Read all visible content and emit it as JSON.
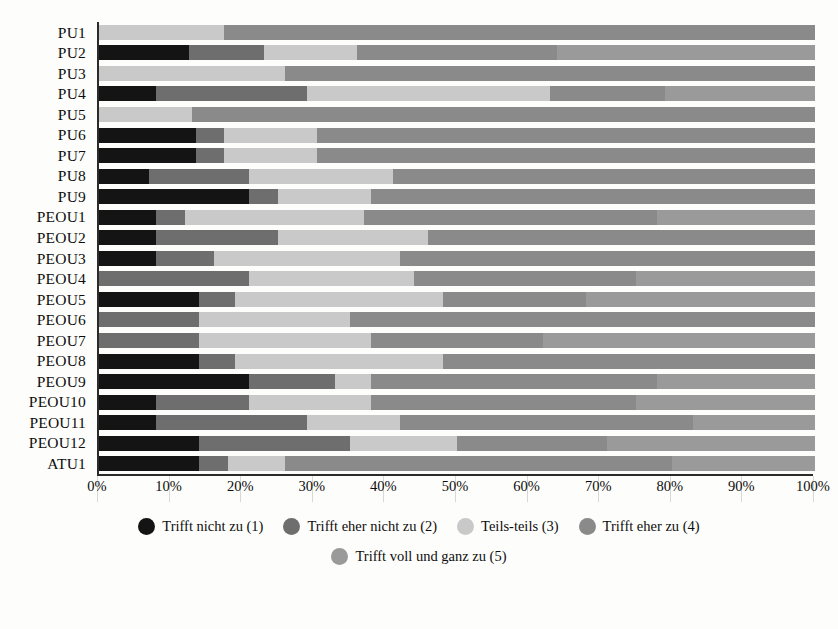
{
  "chart_data": {
    "type": "bar",
    "subtype": "stacked-horizontal-100-percent",
    "title": "",
    "xlabel": "",
    "ylabel": "",
    "xlim": [
      0,
      100
    ],
    "grid": true,
    "legend_position": "bottom",
    "xticks": [
      "0%",
      "10%",
      "20%",
      "30%",
      "40%",
      "50%",
      "60%",
      "70%",
      "80%",
      "90%",
      "100%"
    ],
    "xtick_values": [
      0,
      10,
      20,
      30,
      40,
      50,
      60,
      70,
      80,
      90,
      100
    ],
    "categories": [
      "PU1",
      "PU2",
      "PU3",
      "PU4",
      "PU5",
      "PU6",
      "PU7",
      "PU8",
      "PU9",
      "PEOU1",
      "PEOU2",
      "PEOU3",
      "PEOU4",
      "PEOU5",
      "PEOU6",
      "PEOU7",
      "PEOU8",
      "PEOU9",
      "PEOU10",
      "PEOU11",
      "PEOU12",
      "ATU1"
    ],
    "series": [
      {
        "name": "Trifft nicht zu (1)",
        "color": "#141414",
        "values": [
          0,
          12.5,
          0,
          8,
          0,
          13.5,
          13.5,
          7,
          21,
          8,
          8,
          8,
          0,
          14,
          0,
          0,
          14,
          21,
          8,
          8,
          14,
          14
        ]
      },
      {
        "name": "Trifft eher nicht zu (2)",
        "color": "#6e6e6e",
        "values": [
          0,
          10.5,
          0,
          21,
          0,
          4,
          4,
          14,
          4,
          4,
          17,
          8,
          21,
          5,
          14,
          14,
          5,
          12,
          13,
          21,
          21,
          4
        ]
      },
      {
        "name": "Teils-teils (3)",
        "color": "#c9c9c9",
        "values": [
          17.5,
          13,
          26,
          34,
          13,
          13,
          13,
          20,
          13,
          25,
          21,
          26,
          23,
          29,
          21,
          24,
          29,
          5,
          17,
          13,
          15,
          8
        ]
      },
      {
        "name": "Trifft eher zu (4)",
        "color": "#8a8a8a",
        "values": [
          82.5,
          28,
          74,
          16,
          87,
          69.5,
          69.5,
          59,
          62,
          41,
          54,
          58,
          31,
          20,
          65,
          24,
          52,
          40,
          37,
          41,
          21,
          54
        ]
      },
      {
        "name": "Trifft voll und ganz zu (5)",
        "color": "#9a9a9a",
        "values": [
          0,
          36,
          0,
          21,
          0,
          0,
          0,
          0,
          0,
          22,
          0,
          0,
          25,
          32,
          0,
          38,
          0,
          22,
          25,
          17,
          29,
          20
        ]
      }
    ],
    "legend": [
      {
        "label": "Trifft nicht zu (1)",
        "color": "#141414"
      },
      {
        "label": "Trifft eher nicht zu (2)",
        "color": "#6e6e6e"
      },
      {
        "label": "Teils-teils (3)",
        "color": "#c9c9c9"
      },
      {
        "label": "Trifft eher zu (4)",
        "color": "#8a8a8a"
      },
      {
        "label": "Trifft voll und ganz zu (5)",
        "color": "#9a9a9a"
      }
    ]
  }
}
